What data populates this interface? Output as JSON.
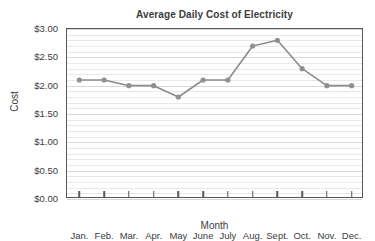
{
  "chart_data": {
    "type": "line",
    "title": "Average Daily Cost of Electricity",
    "xlabel": "Month",
    "ylabel": "Cost",
    "categories": [
      "Jan.",
      "Feb.",
      "Mar.",
      "Apr.",
      "May",
      "June",
      "July",
      "Aug.",
      "Sept.",
      "Oct.",
      "Nov.",
      "Dec."
    ],
    "values": [
      2.1,
      2.1,
      2.0,
      2.0,
      1.8,
      2.1,
      2.1,
      2.7,
      2.8,
      2.3,
      2.0,
      2.0
    ],
    "ylim": [
      0.0,
      3.0
    ],
    "ytick_values": [
      0.0,
      0.5,
      1.0,
      1.5,
      2.0,
      2.5,
      3.0
    ],
    "ytick_labels": [
      "$0.00",
      "$0.50",
      "$1.00",
      "$1.50",
      "$2.00",
      "$2.50",
      "$3.00"
    ],
    "y_minor_step": 0.1,
    "grid": true,
    "legend": false,
    "series_color": "#8c8c8e",
    "axis_color": "#58585a",
    "gridline_color": "#e9e9e9",
    "background": "#ffffff"
  }
}
